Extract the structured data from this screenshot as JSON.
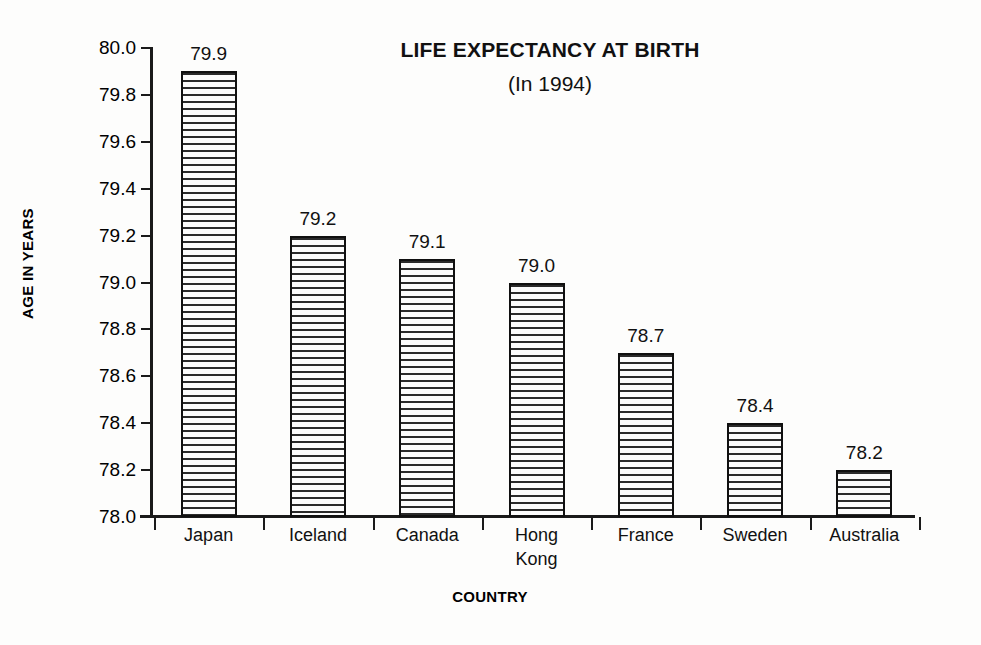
{
  "chart_data": {
    "type": "bar",
    "title": "LIFE EXPECTANCY AT BIRTH",
    "subtitle": "(In 1994)",
    "xlabel": "COUNTRY",
    "ylabel": "AGE IN YEARS",
    "categories": [
      "Japan",
      "Iceland",
      "Canada",
      "Hong\nKong",
      "France",
      "Sweden",
      "Australia"
    ],
    "values": [
      79.9,
      79.2,
      79.1,
      79.0,
      78.7,
      78.4,
      78.2
    ],
    "data_labels": [
      "79.9",
      "79.2",
      "79.1",
      "79.0",
      "78.7",
      "78.4",
      "78.2"
    ],
    "ylim": [
      78.0,
      80.0
    ],
    "ytick_step": 0.2,
    "ytick_labels": [
      "80.0",
      "79.8",
      "79.6",
      "79.4",
      "79.2",
      "79.0",
      "78.8",
      "78.6",
      "78.4",
      "78.2",
      "78.0"
    ],
    "ytick_values": [
      80.0,
      79.8,
      79.6,
      79.4,
      79.2,
      79.0,
      78.8,
      78.6,
      78.4,
      78.2,
      78.0
    ],
    "grid": false,
    "legend": false,
    "bar_fill": "horizontal-line-hatch",
    "colors": {
      "background": "#fdfdfc",
      "axis": "#1a1a1a",
      "bar_border": "#101010",
      "bar_hatch": "#2a2a2a",
      "text": "#111111"
    }
  }
}
